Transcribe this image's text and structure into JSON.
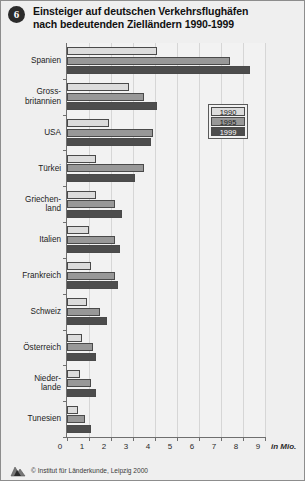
{
  "header": {
    "badge_number": "6",
    "title_line1": "Einsteiger auf deutschen Verkehrsflughäfen",
    "title_line2": "nach bedeutenden Zielländern 1990-1999"
  },
  "footer": {
    "credit": "© Institut für Länderkunde, Leipzig 2000",
    "logo_icon": "institute-logo-icon"
  },
  "legend": {
    "position": "inside-upper-right",
    "entries": [
      {
        "label": "1990",
        "color": "#dcdcdc"
      },
      {
        "label": "1995",
        "color": "#989898"
      },
      {
        "label": "1999",
        "color": "#4d4d4d"
      }
    ]
  },
  "chart_data": {
    "type": "bar",
    "orientation": "horizontal",
    "title": "Einsteiger auf deutschen Verkehrsflughäfen nach bedeutenden Zielländern 1990-1999",
    "xlabel": "in Mio.",
    "ylabel": "",
    "unit": "in Mio.",
    "xlim": [
      0,
      9
    ],
    "xticks": [
      "0",
      "1",
      "2",
      "3",
      "4",
      "5",
      "6",
      "7",
      "8",
      "9"
    ],
    "grid": true,
    "categories": [
      "Spanien",
      "Gross-\nbritannien",
      "USA",
      "Türkei",
      "Griechen-\nland",
      "Italien",
      "Frankreich",
      "Schweiz",
      "Österreich",
      "Nieder-\nlande",
      "Tunesien"
    ],
    "series": [
      {
        "name": "1990",
        "color": "#dcdcdc",
        "values": [
          4.1,
          2.8,
          1.9,
          1.3,
          1.3,
          1.0,
          1.1,
          0.9,
          0.7,
          0.6,
          0.5
        ]
      },
      {
        "name": "1995",
        "color": "#989898",
        "values": [
          7.4,
          3.5,
          3.9,
          3.5,
          2.2,
          2.2,
          2.2,
          1.5,
          1.2,
          1.1,
          0.8
        ]
      },
      {
        "name": "1999",
        "color": "#4d4d4d",
        "values": [
          8.3,
          4.1,
          3.8,
          3.1,
          2.5,
          2.4,
          2.3,
          1.8,
          1.3,
          1.3,
          1.1
        ]
      }
    ]
  }
}
